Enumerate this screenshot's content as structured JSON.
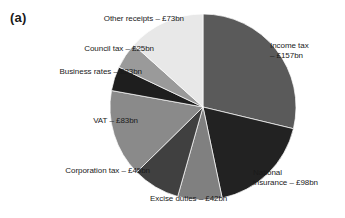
{
  "figure": {
    "panel_letter": "(a)",
    "background_color": "#ffffff"
  },
  "chart_data": {
    "type": "pie",
    "title": "",
    "subtitle": "",
    "xlabel": "",
    "ylabel": "",
    "units": "£bn",
    "total": 546,
    "legend_position": "none",
    "labels_position": "outside",
    "start_angle_deg": 0,
    "direction": "clockwise",
    "center": {
      "x": 203,
      "y": 107
    },
    "radius": 93,
    "categories": [
      "Income tax",
      "National insurance",
      "Excise duties",
      "Corporation tax",
      "VAT",
      "Business rates",
      "Council tax",
      "Other receipts"
    ],
    "values": [
      157,
      98,
      42,
      45,
      83,
      23,
      25,
      73
    ],
    "colors": [
      "#5a5a5a",
      "#222222",
      "#808080",
      "#404040",
      "#8a8a8a",
      "#1e1e1e",
      "#9a9a9a",
      "#e8e8e8"
    ],
    "slices": [
      {
        "name": "Income tax",
        "value": 157,
        "value_text": "£157bn",
        "label_text": "Income tax\n– £157bn",
        "color": "#5a5a5a",
        "percent": 28.8,
        "start_angle_deg": 0,
        "end_angle_deg": 103.5
      },
      {
        "name": "National insurance",
        "value": 98,
        "value_text": "£98bn",
        "label_text": "National\ninsurance – £98bn",
        "color": "#222222",
        "percent": 17.9,
        "start_angle_deg": 103.5,
        "end_angle_deg": 168.1
      },
      {
        "name": "Excise duties",
        "value": 42,
        "value_text": "£42bn",
        "label_text": "Excise duties – £42bn",
        "color": "#808080",
        "percent": 7.7,
        "start_angle_deg": 168.1,
        "end_angle_deg": 195.8
      },
      {
        "name": "Corporation tax",
        "value": 45,
        "value_text": "£45bn",
        "label_text": "Corporation tax – £45bn",
        "color": "#404040",
        "percent": 8.2,
        "start_angle_deg": 195.8,
        "end_angle_deg": 225.5
      },
      {
        "name": "VAT",
        "value": 83,
        "value_text": "£83bn",
        "label_text": "VAT – £83bn",
        "color": "#8a8a8a",
        "percent": 15.2,
        "start_angle_deg": 225.5,
        "end_angle_deg": 280.2
      },
      {
        "name": "Business rates",
        "value": 23,
        "value_text": "£23bn",
        "label_text": "Business rates – £23bn",
        "color": "#1e1e1e",
        "percent": 4.2,
        "start_angle_deg": 280.2,
        "end_angle_deg": 295.4
      },
      {
        "name": "Council tax",
        "value": 25,
        "value_text": "£25bn",
        "label_text": "Council tax – £25bn",
        "color": "#9a9a9a",
        "percent": 4.6,
        "start_angle_deg": 295.4,
        "end_angle_deg": 311.9
      },
      {
        "name": "Other receipts",
        "value": 73,
        "value_text": "£73bn",
        "label_text": "Other receipts – £73bn",
        "color": "#e8e8e8",
        "percent": 13.4,
        "start_angle_deg": 311.9,
        "end_angle_deg": 360
      }
    ]
  }
}
